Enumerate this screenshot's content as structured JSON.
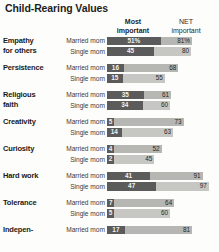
{
  "chart_data": {
    "type": "bar",
    "title": "Child-Rearing Values",
    "subtype": "grouped-stacked-horizontal",
    "xlabel": "",
    "ylabel": "",
    "grid": false,
    "legend_position": "top-as-column-headers",
    "columns": {
      "most_important": "Most\nimportant",
      "most_important_line1": "Most",
      "most_important_line2": "important",
      "net_important_line1": "NET",
      "net_important_line2": "important"
    },
    "series": [
      {
        "name": "Most important",
        "color": "#5b5b5b"
      },
      {
        "name": "NET important",
        "color": "#b6b6b2"
      }
    ],
    "xlim": [
      0,
      100
    ],
    "categories": [
      "Empathy for others",
      "Persistence",
      "Religious faith",
      "Creativity",
      "Curiosity",
      "Hard work",
      "Tolerance",
      "Indepen-"
    ],
    "groups": [
      {
        "category_line1": "Empathy",
        "category_line2": "for others",
        "rows": [
          {
            "label": "Married mom",
            "most": 51,
            "net": 81,
            "most_text": "51%",
            "net_text": "81%"
          },
          {
            "label": "Single mom",
            "most": 45,
            "net": 80,
            "most_text": "45",
            "net_text": "80"
          }
        ]
      },
      {
        "category_line1": "Persistence",
        "category_line2": "",
        "rows": [
          {
            "label": "Married mom",
            "most": 16,
            "net": 68,
            "most_text": "16",
            "net_text": "68"
          },
          {
            "label": "Single mom",
            "most": 15,
            "net": 55,
            "most_text": "15",
            "net_text": "55"
          }
        ]
      },
      {
        "category_line1": "Religious",
        "category_line2": "faith",
        "rows": [
          {
            "label": "Married mom",
            "most": 35,
            "net": 61,
            "most_text": "35",
            "net_text": "61"
          },
          {
            "label": "Single mom",
            "most": 34,
            "net": 60,
            "most_text": "34",
            "net_text": "60"
          }
        ]
      },
      {
        "category_line1": "Creativity",
        "category_line2": "",
        "rows": [
          {
            "label": "Married mom",
            "most": 5,
            "net": 73,
            "most_text": "5",
            "net_text": "73"
          },
          {
            "label": "Single mom",
            "most": 14,
            "net": 63,
            "most_text": "14",
            "net_text": "63"
          }
        ]
      },
      {
        "category_line1": "Curiosity",
        "category_line2": "",
        "rows": [
          {
            "label": "Married mom",
            "most": 4,
            "net": 52,
            "most_text": "4",
            "net_text": "52"
          },
          {
            "label": "Single mom",
            "most": 2,
            "net": 45,
            "most_text": "2",
            "net_text": "45"
          }
        ]
      },
      {
        "category_line1": "Hard work",
        "category_line2": "",
        "rows": [
          {
            "label": "Married mom",
            "most": 41,
            "net": 91,
            "most_text": "41",
            "net_text": "91"
          },
          {
            "label": "Single mom",
            "most": 47,
            "net": 97,
            "most_text": "47",
            "net_text": "97"
          }
        ]
      },
      {
        "category_line1": "Tolerance",
        "category_line2": "",
        "rows": [
          {
            "label": "Married mom",
            "most": 7,
            "net": 64,
            "most_text": "7",
            "net_text": "64"
          },
          {
            "label": "Single mom",
            "most": 5,
            "net": 60,
            "most_text": "5",
            "net_text": "60"
          }
        ]
      },
      {
        "category_line1": "Indepen-",
        "category_line2": "",
        "rows": [
          {
            "label": "Married mom",
            "most": 17,
            "net": 81,
            "most_text": "17",
            "net_text": "81"
          }
        ]
      }
    ]
  }
}
